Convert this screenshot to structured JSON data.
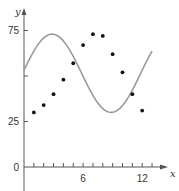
{
  "chart_data": {
    "type": "scatter",
    "title": "",
    "xlabel": "x",
    "ylabel": "y",
    "xlim": [
      0,
      14
    ],
    "ylim": [
      0,
      80
    ],
    "grid": false,
    "legend": null,
    "x_ticks": [
      1,
      2,
      3,
      4,
      5,
      6,
      7,
      8,
      9,
      10,
      11,
      12,
      13
    ],
    "x_tick_labels": [
      {
        "value": 6,
        "label": "6"
      },
      {
        "value": 12,
        "label": "12"
      }
    ],
    "y_ticks": [
      0,
      25,
      50,
      75
    ],
    "y_tick_labels": [
      {
        "value": 0,
        "label": "0"
      },
      {
        "value": 25,
        "label": "25"
      },
      {
        "value": 75,
        "label": "75"
      }
    ],
    "series": [
      {
        "name": "data points",
        "kind": "scatter",
        "color": "#111111",
        "x": [
          1,
          2,
          3,
          4,
          5,
          6,
          7,
          8,
          9,
          10,
          11,
          12
        ],
        "y": [
          30,
          34,
          40,
          48,
          57,
          67,
          73,
          72,
          62,
          52,
          40,
          31
        ]
      },
      {
        "name": "sinusoidal curve",
        "kind": "line",
        "color": "#999999",
        "function": "y = 51.5 + 21.5*sin(0.5236*(x - 0) + 0.42)",
        "x_range": [
          0,
          13
        ]
      }
    ]
  },
  "colors": {
    "axis": "#555555",
    "curve": "#9a9a9a",
    "points": "#111111"
  }
}
